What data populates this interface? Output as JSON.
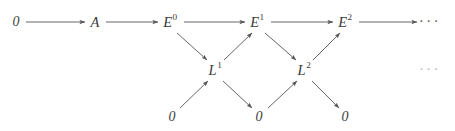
{
  "figure": {
    "kind": "commutative-diagram",
    "width": 455,
    "height": 131,
    "background_color": "#ffffff",
    "line_color": "#555555",
    "text_color": "#3a3a3a"
  },
  "nodes": {
    "top_zero": {
      "label": "0",
      "x": 16,
      "y": 22
    },
    "a": {
      "base": "A",
      "sup": "",
      "x": 95,
      "y": 22
    },
    "e0": {
      "base": "E",
      "sup": "0",
      "x": 170,
      "y": 22
    },
    "e1": {
      "base": "E",
      "sup": "1",
      "x": 257,
      "y": 22
    },
    "e2": {
      "base": "E",
      "sup": "2",
      "x": 345,
      "y": 22
    },
    "l1": {
      "base": "L",
      "sup": "1",
      "x": 215,
      "y": 70
    },
    "l2": {
      "base": "L",
      "sup": "2",
      "x": 304,
      "y": 70
    },
    "bottom_zero_1": {
      "label": "0",
      "x": 172,
      "y": 117
    },
    "bottom_zero_2": {
      "label": "0",
      "x": 259,
      "y": 117
    },
    "bottom_zero_3": {
      "label": "0",
      "x": 345,
      "y": 117
    }
  },
  "ellipses": {
    "top_right": {
      "label": "···",
      "x": 430,
      "y": 22
    },
    "middle_right": {
      "label": "···",
      "x": 430,
      "y": 70
    }
  },
  "arrows": [
    {
      "name": "zero-to-a",
      "from": "top_zero",
      "to": "a",
      "x1": 26,
      "y1": 22,
      "x2": 85,
      "y2": 22,
      "direction": "right"
    },
    {
      "name": "a-to-e0",
      "from": "a",
      "to": "e0",
      "x1": 106,
      "y1": 22,
      "x2": 158,
      "y2": 22,
      "direction": "right"
    },
    {
      "name": "e0-to-e1",
      "from": "e0",
      "to": "e1",
      "x1": 184,
      "y1": 22,
      "x2": 245,
      "y2": 22,
      "direction": "right"
    },
    {
      "name": "e1-to-e2",
      "from": "e1",
      "to": "e2",
      "x1": 271,
      "y1": 22,
      "x2": 333,
      "y2": 22,
      "direction": "right"
    },
    {
      "name": "e2-to-ellipsis",
      "from": "e2",
      "to": "top_right_ellipsis",
      "x1": 359,
      "y1": 22,
      "x2": 417,
      "y2": 22,
      "direction": "right"
    },
    {
      "name": "e0-to-l1",
      "from": "e0",
      "to": "l1",
      "x1": 177,
      "y1": 33,
      "x2": 207,
      "y2": 60,
      "direction": "down-right"
    },
    {
      "name": "l1-to-e1",
      "from": "l1",
      "to": "e1",
      "x1": 224,
      "y1": 60,
      "x2": 252,
      "y2": 33,
      "direction": "up-right"
    },
    {
      "name": "e1-to-l2",
      "from": "e1",
      "to": "l2",
      "x1": 265,
      "y1": 33,
      "x2": 296,
      "y2": 60,
      "direction": "down-right"
    },
    {
      "name": "l2-to-e2",
      "from": "l2",
      "to": "e2",
      "x1": 313,
      "y1": 60,
      "x2": 340,
      "y2": 33,
      "direction": "up-right"
    },
    {
      "name": "zero-to-l1",
      "from": "bottom_zero_1",
      "to": "l1",
      "x1": 180,
      "y1": 108,
      "x2": 208,
      "y2": 81,
      "direction": "up-right"
    },
    {
      "name": "l1-to-zero",
      "from": "l1",
      "to": "bottom_zero_2",
      "x1": 223,
      "y1": 81,
      "x2": 252,
      "y2": 108,
      "direction": "down-right"
    },
    {
      "name": "zero-to-l2",
      "from": "bottom_zero_2",
      "to": "l2",
      "x1": 268,
      "y1": 108,
      "x2": 297,
      "y2": 81,
      "direction": "up-right"
    },
    {
      "name": "l2-to-zero",
      "from": "l2",
      "to": "bottom_zero_3",
      "x1": 312,
      "y1": 81,
      "x2": 339,
      "y2": 108,
      "direction": "down-right"
    }
  ]
}
